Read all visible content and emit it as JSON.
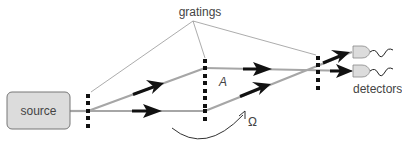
{
  "labels": {
    "gratings": "gratings",
    "source": "source",
    "detectors": "detectors",
    "path_a": "A",
    "rotation": "Ω"
  },
  "colors": {
    "beam": "#a6a6a6",
    "arrow": "#111111",
    "source_fill": "#dcdcdc",
    "source_stroke": "#777777",
    "detector_fill": "#dcdcdc",
    "grating": "#111111",
    "leader_line": "#888888",
    "text": "#444444"
  },
  "components": [
    {
      "id": "source",
      "type": "box"
    },
    {
      "id": "grating-1",
      "type": "grating",
      "x": 88
    },
    {
      "id": "grating-2",
      "type": "grating",
      "x": 205
    },
    {
      "id": "grating-3",
      "type": "grating",
      "x": 318
    },
    {
      "id": "detector-1",
      "type": "detector"
    },
    {
      "id": "detector-2",
      "type": "detector"
    }
  ]
}
